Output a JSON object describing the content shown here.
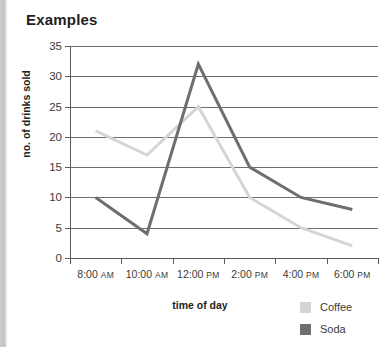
{
  "chart_data": {
    "type": "line",
    "title": "Examples",
    "xlabel": "time of day",
    "ylabel": "no. of drinks sold",
    "categories": [
      "8:00 AM",
      "10:00 AM",
      "12:00 PM",
      "2:00 PM",
      "4:00 PM",
      "6:00 PM"
    ],
    "series": [
      {
        "name": "Coffee",
        "color": "#d5d5d5",
        "values": [
          21,
          17,
          25,
          10,
          5,
          2
        ]
      },
      {
        "name": "Soda",
        "color": "#6e6e6e",
        "values": [
          10,
          4,
          32,
          15,
          10,
          8
        ]
      }
    ],
    "ylim": [
      0,
      35
    ],
    "y_ticks": [
      0,
      5,
      10,
      15,
      20,
      25,
      30,
      35
    ],
    "y_tick_labels": [
      "0",
      "5",
      "10",
      "15",
      "20",
      "25",
      "30",
      "35"
    ],
    "grid": true,
    "legend_position": "bottom-right",
    "markers": false
  },
  "x_tick_parts": [
    {
      "time": "8:00",
      "meridiem": "AM"
    },
    {
      "time": "10:00",
      "meridiem": "AM"
    },
    {
      "time": "12:00",
      "meridiem": "PM"
    },
    {
      "time": "2:00",
      "meridiem": "PM"
    },
    {
      "time": "4:00",
      "meridiem": "PM"
    },
    {
      "time": "6:00",
      "meridiem": "PM"
    }
  ],
  "colors": {
    "coffee": "#d5d5d5",
    "soda": "#6e6e6e",
    "gridline": "#6f6f6f",
    "axis": "#5a5a5a",
    "title_text": "#231f20",
    "tick_text": "#3a3a3a",
    "page_edge": "#c8c8c8"
  }
}
